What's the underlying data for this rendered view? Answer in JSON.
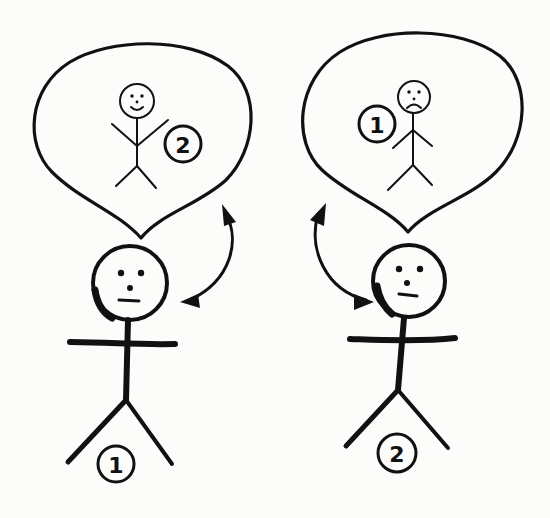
{
  "diagram": {
    "type": "perception-empathy-sketch",
    "colors": {
      "ink": "#111111",
      "paper": "#fcfcfb"
    },
    "people": [
      {
        "id": "person-1",
        "label": "1",
        "expression": "neutral",
        "thought_bubble": {
          "imagined_person_label": "2",
          "imagined_expression": "happy"
        }
      },
      {
        "id": "person-2",
        "label": "2",
        "expression": "neutral",
        "thought_bubble": {
          "imagined_person_label": "1",
          "imagined_expression": "sad"
        }
      }
    ],
    "connectors": [
      {
        "from": "person-1",
        "to": "thought-bubble-1",
        "style": "curved-double-arrow"
      },
      {
        "from": "person-2",
        "to": "thought-bubble-2",
        "style": "curved-double-arrow"
      }
    ]
  }
}
